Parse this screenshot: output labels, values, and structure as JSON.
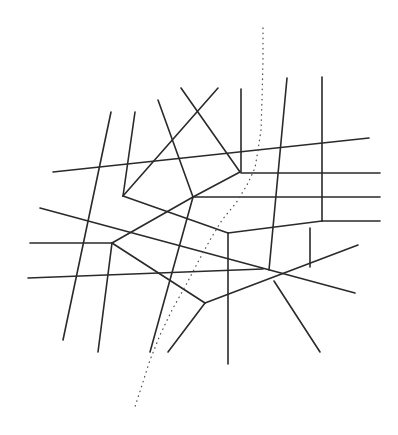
{
  "diagram": {
    "type": "line-network",
    "background": "#ffffff",
    "line_color": "#2a2a2a",
    "dotted_color": "#555555",
    "segments": [
      {
        "x1": 53,
        "y1": 172,
        "x2": 369,
        "y2": 138
      },
      {
        "x1": 111,
        "y1": 112,
        "x2": 63,
        "y2": 340
      },
      {
        "x1": 135,
        "y1": 112,
        "x2": 123,
        "y2": 196
      },
      {
        "x1": 158,
        "y1": 100,
        "x2": 193,
        "y2": 197
      },
      {
        "x1": 181,
        "y1": 88,
        "x2": 240,
        "y2": 172
      },
      {
        "x1": 218,
        "y1": 88,
        "x2": 123,
        "y2": 196
      },
      {
        "x1": 241,
        "y1": 89,
        "x2": 241,
        "y2": 172
      },
      {
        "x1": 240,
        "y1": 172,
        "x2": 193,
        "y2": 197
      },
      {
        "x1": 241,
        "y1": 173,
        "x2": 380,
        "y2": 173
      },
      {
        "x1": 193,
        "y1": 197,
        "x2": 380,
        "y2": 197
      },
      {
        "x1": 287,
        "y1": 78,
        "x2": 269,
        "y2": 270
      },
      {
        "x1": 322,
        "y1": 77,
        "x2": 322,
        "y2": 221
      },
      {
        "x1": 123,
        "y1": 196,
        "x2": 228,
        "y2": 233
      },
      {
        "x1": 228,
        "y1": 233,
        "x2": 322,
        "y2": 221
      },
      {
        "x1": 322,
        "y1": 221,
        "x2": 380,
        "y2": 221
      },
      {
        "x1": 193,
        "y1": 197,
        "x2": 112,
        "y2": 243
      },
      {
        "x1": 193,
        "y1": 197,
        "x2": 150,
        "y2": 352
      },
      {
        "x1": 40,
        "y1": 208,
        "x2": 355,
        "y2": 293
      },
      {
        "x1": 112,
        "y1": 243,
        "x2": 30,
        "y2": 243
      },
      {
        "x1": 112,
        "y1": 243,
        "x2": 205,
        "y2": 303
      },
      {
        "x1": 112,
        "y1": 243,
        "x2": 98,
        "y2": 352
      },
      {
        "x1": 28,
        "y1": 278,
        "x2": 263,
        "y2": 269
      },
      {
        "x1": 228,
        "y1": 233,
        "x2": 228,
        "y2": 364
      },
      {
        "x1": 310,
        "y1": 228,
        "x2": 310,
        "y2": 267
      },
      {
        "x1": 205,
        "y1": 303,
        "x2": 168,
        "y2": 352
      },
      {
        "x1": 205,
        "y1": 303,
        "x2": 358,
        "y2": 245
      },
      {
        "x1": 274,
        "y1": 281,
        "x2": 320,
        "y2": 352
      }
    ],
    "dotted_path": [
      [
        263,
        28
      ],
      [
        263,
        60
      ],
      [
        262,
        100
      ],
      [
        261,
        130
      ],
      [
        258,
        150
      ],
      [
        255,
        168
      ],
      [
        247,
        185
      ],
      [
        236,
        203
      ],
      [
        222,
        220
      ],
      [
        210,
        240
      ],
      [
        198,
        262
      ],
      [
        186,
        285
      ],
      [
        172,
        310
      ],
      [
        160,
        335
      ],
      [
        150,
        360
      ],
      [
        142,
        385
      ],
      [
        134,
        410
      ]
    ]
  }
}
